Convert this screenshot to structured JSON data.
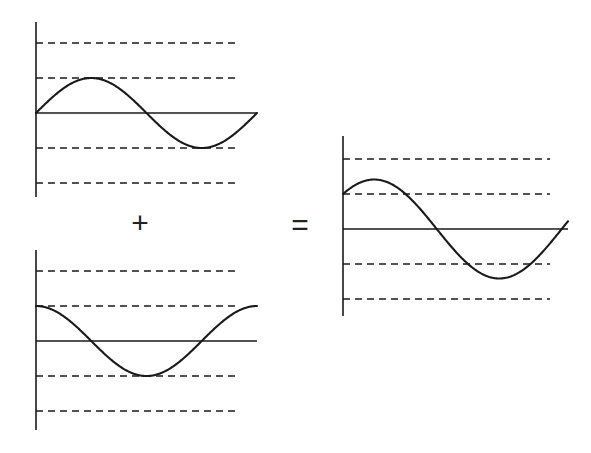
{
  "figure": {
    "background_color": "#ffffff",
    "stroke_color": "#1a1a1a",
    "gridline_color": "#1a1a1a",
    "operators": {
      "plus": "+",
      "equals": "="
    }
  },
  "chart_data": [
    {
      "id": "panel-1",
      "type": "line",
      "title": "",
      "xlabel": "",
      "ylabel": "",
      "expression": "sin(x)",
      "amplitude": 1,
      "phase_deg": 0,
      "xlim": [
        0,
        6.283185307179586
      ],
      "ylim": [
        -2.4,
        2.4
      ],
      "grid": true,
      "gridlines_y": [
        2,
        1,
        -1,
        -2
      ],
      "axis_y": 0,
      "legend": "none",
      "x": [
        0,
        0.3141592653589793,
        0.6283185307179586,
        0.9424777960769379,
        1.2566370614359172,
        1.5707963267948966,
        1.8849555921538759,
        2.199114857512855,
        2.5132741228718345,
        2.827433388230814,
        3.141592653589793,
        3.455751918948772,
        3.7699111843077517,
        4.084070449666731,
        4.39822971502571,
        4.71238898038469,
        5.026548245743669,
        5.340707511102648,
        5.654866776461628,
        5.969026041820607,
        6.283185307179586
      ],
      "values": [
        0.0,
        0.309,
        0.588,
        0.809,
        0.951,
        1.0,
        0.951,
        0.809,
        0.588,
        0.309,
        0.0,
        -0.309,
        -0.588,
        -0.809,
        -0.951,
        -1.0,
        -0.951,
        -0.809,
        -0.588,
        -0.309,
        0.0
      ]
    },
    {
      "id": "panel-2",
      "type": "line",
      "title": "",
      "xlabel": "",
      "ylabel": "",
      "expression": "cos(x)",
      "amplitude": 1,
      "phase_deg": 90,
      "xlim": [
        0,
        6.283185307179586
      ],
      "ylim": [
        -2.4,
        2.4
      ],
      "grid": true,
      "gridlines_y": [
        2,
        1,
        -1,
        -2
      ],
      "axis_y": 0,
      "legend": "none",
      "x": [
        0,
        0.3141592653589793,
        0.6283185307179586,
        0.9424777960769379,
        1.2566370614359172,
        1.5707963267948966,
        1.8849555921538759,
        2.199114857512855,
        2.5132741228718345,
        2.827433388230814,
        3.141592653589793,
        3.455751918948772,
        3.7699111843077517,
        4.084070449666731,
        4.39822971502571,
        4.71238898038469,
        5.026548245743669,
        5.340707511102648,
        5.654866776461628,
        5.969026041820607,
        6.283185307179586
      ],
      "values": [
        1.0,
        0.951,
        0.809,
        0.588,
        0.309,
        0.0,
        -0.309,
        -0.588,
        -0.809,
        -0.951,
        -1.0,
        -0.951,
        -0.809,
        -0.588,
        -0.309,
        0.0,
        0.309,
        0.588,
        0.809,
        0.951,
        1.0
      ]
    },
    {
      "id": "panel-3",
      "type": "line",
      "title": "",
      "xlabel": "",
      "ylabel": "",
      "expression": "sin(x) + cos(x)",
      "amplitude": 1.414,
      "phase_deg": 45,
      "xlim": [
        0,
        5.654866776461628
      ],
      "ylim": [
        -2.4,
        2.4
      ],
      "grid": true,
      "gridlines_y": [
        2,
        1,
        -1,
        -2
      ],
      "axis_y": 0,
      "legend": "none",
      "x": [
        0,
        0.3141592653589793,
        0.6283185307179586,
        0.9424777960769379,
        1.2566370614359172,
        1.5707963267948966,
        1.8849555921538759,
        2.199114857512855,
        2.5132741228718345,
        2.827433388230814,
        3.141592653589793,
        3.455751918948772,
        3.7699111843077517,
        4.084070449666731,
        4.39822971502571,
        4.71238898038469,
        5.026548245743669,
        5.340707511102648,
        5.654866776461628
      ],
      "values": [
        1.0,
        1.26,
        1.397,
        1.397,
        1.26,
        1.0,
        0.642,
        0.221,
        -0.221,
        -0.642,
        -1.0,
        -1.26,
        -1.397,
        -1.397,
        -1.26,
        -1.0,
        -0.642,
        -0.221,
        0.221
      ]
    }
  ],
  "panels": [
    {
      "name": "panel-sine",
      "geometry": {
        "axis_x": 36,
        "axis_y": 113,
        "top": 22,
        "bottom": 197,
        "plot_right": 257,
        "grid_right": 237,
        "unit_y": 35
      }
    },
    {
      "name": "panel-cosine",
      "geometry": {
        "axis_x": 36,
        "axis_y": 341,
        "top": 250,
        "bottom": 430,
        "plot_right": 257,
        "grid_right": 237,
        "unit_y": 35
      }
    },
    {
      "name": "panel-sum",
      "geometry": {
        "axis_x": 343,
        "axis_y": 229,
        "top": 136,
        "bottom": 316,
        "plot_right": 568,
        "grid_right": 550,
        "unit_y": 35
      }
    }
  ]
}
